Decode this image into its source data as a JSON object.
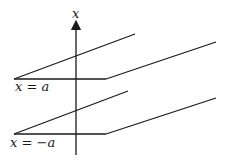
{
  "diagram": {
    "axis_label": "x",
    "planes": [
      {
        "label": "x = a"
      },
      {
        "label": "x = −a"
      }
    ],
    "colors": {
      "stroke": "#1a1a1a",
      "background": "#ffffff"
    }
  }
}
